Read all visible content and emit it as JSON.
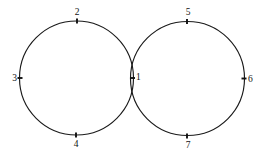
{
  "diagram": {
    "type": "geometric-figure",
    "background_color": "#ffffff",
    "stroke_color": "#1a1a1a",
    "label_color": "#111111",
    "canvas": {
      "width": 261,
      "height": 155
    },
    "shapes": [
      {
        "name": "left-circle",
        "cx": 76.5,
        "cy": 78,
        "r": 57
      },
      {
        "name": "right-circle",
        "cx": 187.5,
        "cy": 78.5,
        "r": 57
      }
    ],
    "points": [
      {
        "id": "point-1",
        "label": "1",
        "mark_x": 132.5,
        "mark_y": 78,
        "label_x": 136,
        "label_y": 80,
        "tick_angle": 0,
        "tick_len": 5,
        "anchor": "start"
      },
      {
        "id": "point-2",
        "label": "2",
        "mark_x": 77,
        "mark_y": 21,
        "label_x": 77,
        "label_y": 15,
        "tick_angle": 90,
        "tick_len": 5,
        "anchor": "middle"
      },
      {
        "id": "point-3",
        "label": "3",
        "mark_x": 20,
        "mark_y": 78,
        "label_x": 17,
        "label_y": 81,
        "tick_angle": 0,
        "tick_len": 5,
        "anchor": "end"
      },
      {
        "id": "point-4",
        "label": "4",
        "mark_x": 76,
        "mark_y": 135,
        "label_x": 76,
        "label_y": 147,
        "tick_angle": 90,
        "tick_len": 5,
        "anchor": "middle"
      },
      {
        "id": "point-5",
        "label": "5",
        "mark_x": 187,
        "mark_y": 21.5,
        "label_x": 188,
        "label_y": 15,
        "tick_angle": 90,
        "tick_len": 5,
        "anchor": "middle"
      },
      {
        "id": "point-6",
        "label": "6",
        "mark_x": 244,
        "mark_y": 78.5,
        "label_x": 248,
        "label_y": 81.5,
        "tick_angle": 0,
        "tick_len": 5,
        "anchor": "start"
      },
      {
        "id": "point-7",
        "label": "7",
        "mark_x": 187,
        "mark_y": 136,
        "label_x": 188,
        "label_y": 148,
        "tick_angle": 90,
        "tick_len": 5,
        "anchor": "middle"
      }
    ]
  }
}
